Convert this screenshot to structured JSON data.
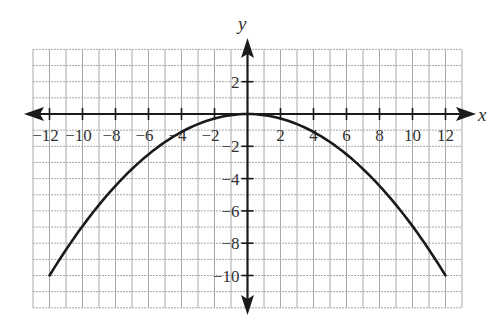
{
  "chart_data": {
    "type": "line",
    "title": "",
    "xlabel": "x",
    "ylabel": "y",
    "xlim": [
      -13,
      13
    ],
    "ylim": [
      -12,
      4
    ],
    "grid": true,
    "grid_step": 1,
    "x_ticks": [
      -12,
      -10,
      -8,
      -6,
      -4,
      -2,
      2,
      4,
      6,
      8,
      10,
      12
    ],
    "y_ticks": [
      2,
      -2,
      -4,
      -6,
      -8,
      -10
    ],
    "x_tick_labels": [
      "−12",
      "−10",
      "−8",
      "−6",
      "−4",
      "−2",
      "2",
      "4",
      "6",
      "8",
      "10",
      "12"
    ],
    "y_tick_labels": [
      "2",
      "−2",
      "−4",
      "−6",
      "−8",
      "−10"
    ],
    "series": [
      {
        "name": "parabola",
        "equation": "y = -(5/72) x^2",
        "x": [
          -12,
          -10,
          -8,
          -6,
          -4,
          -2,
          0,
          2,
          4,
          6,
          8,
          10,
          12
        ],
        "y": [
          -10,
          -6.94,
          -4.44,
          -2.5,
          -1.11,
          -0.28,
          0,
          -0.28,
          -1.11,
          -2.5,
          -4.44,
          -6.94,
          -10
        ],
        "color": "#1a1a1a"
      }
    ],
    "legend": null
  },
  "labels": {
    "x_axis": "x",
    "y_axis": "y"
  }
}
